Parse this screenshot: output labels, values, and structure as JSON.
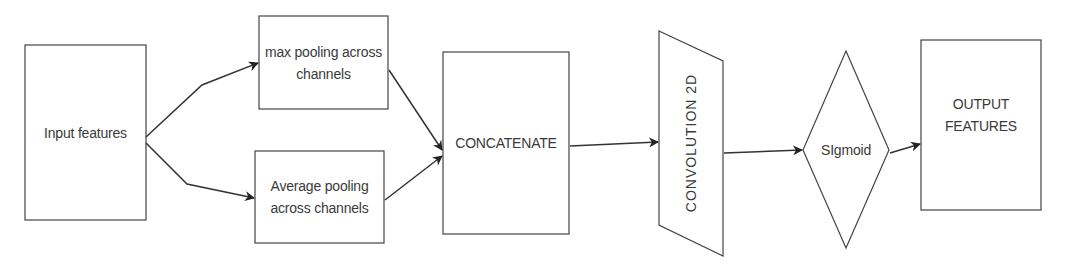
{
  "diagram": {
    "nodes": {
      "input": {
        "label": "Input features",
        "shape": "rectangle"
      },
      "max_pool": {
        "label": "max pooling across channels",
        "shape": "rectangle"
      },
      "avg_pool": {
        "label": "Average pooling across channels",
        "shape": "rectangle"
      },
      "concat": {
        "label": "CONCATENATE",
        "shape": "rectangle"
      },
      "conv": {
        "label": "CONVOLUTION 2D",
        "shape": "parallelogram"
      },
      "sigmoid": {
        "label": "SIgmoid",
        "shape": "diamond"
      },
      "output": {
        "label": "OUTPUT FEATURES",
        "shape": "rectangle"
      }
    },
    "edges": [
      {
        "from": "Input features",
        "to": "max pooling across channels"
      },
      {
        "from": "Input features",
        "to": "Average pooling across channels"
      },
      {
        "from": "max pooling across channels",
        "to": "CONCATENATE"
      },
      {
        "from": "Average pooling across channels",
        "to": "CONCATENATE"
      },
      {
        "from": "CONCATENATE",
        "to": "CONVOLUTION 2D"
      },
      {
        "from": "CONVOLUTION 2D",
        "to": "SIgmoid"
      },
      {
        "from": "SIgmoid",
        "to": "OUTPUT FEATURES"
      }
    ],
    "colors": {
      "stroke": "#333333",
      "text": "#3a3a3a",
      "background": "#ffffff"
    }
  }
}
